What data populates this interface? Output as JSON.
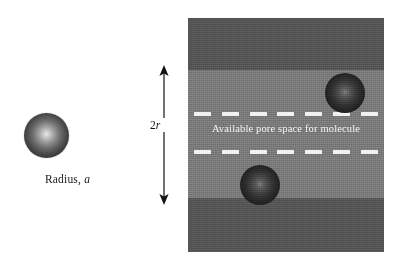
{
  "figure": {
    "type": "schematic-diagram",
    "background_color": "#ffffff"
  },
  "molecule_panel": {
    "sphere": {
      "icon": "sphere-molecule",
      "center_x": 46,
      "center_y": 136,
      "radius": 22,
      "fill_center_color": "#e9e9e9",
      "fill_edge_color": "#1e1e1e"
    },
    "label_prefix": "Radius, ",
    "label_symbol": "a"
  },
  "dimension": {
    "icon": "double-headed-arrow-vertical",
    "label_prefix": "2",
    "label_symbol": "r",
    "arrow_color": "#141414",
    "top_y": 68,
    "bottom_y": 200
  },
  "pore_slab": {
    "wall_color": "#545454",
    "channel_color": "#787878",
    "dash_color": "#f2f2f2",
    "text_color": "#f4f4f4",
    "space_label": "Available pore space for molecule",
    "dash_count": 7,
    "dashed_lines": [
      {
        "name": "upper-accessible-boundary",
        "y": 94
      },
      {
        "name": "lower-accessible-boundary",
        "y": 132
      }
    ],
    "spheres": [
      {
        "name": "pore-sphere-upper",
        "center_x": 345,
        "center_y": 93,
        "radius": 20
      },
      {
        "name": "pore-sphere-lower",
        "center_x": 260,
        "center_y": 185,
        "radius": 20
      }
    ]
  }
}
